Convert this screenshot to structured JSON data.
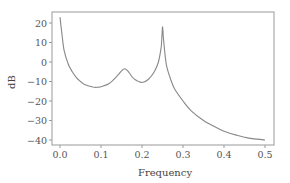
{
  "chart_data": {
    "type": "line",
    "title": "",
    "xlabel": "Frequency",
    "ylabel": "dB",
    "xlim": [
      0.0,
      0.5
    ],
    "ylim": [
      -42,
      27
    ],
    "x_ticks": [
      "0.0",
      "0.1",
      "0.2",
      "0.3",
      "0.4",
      "0.5"
    ],
    "y_ticks": [
      "20",
      "10",
      "0",
      "-10",
      "-20",
      "-30",
      "-40"
    ],
    "grid": false,
    "legend": null,
    "series": [
      {
        "name": "spectrum",
        "color": "#888888",
        "x": [
          0.0,
          0.005,
          0.01,
          0.02,
          0.03,
          0.04,
          0.05,
          0.06,
          0.08,
          0.09,
          0.1,
          0.12,
          0.14,
          0.15,
          0.157,
          0.165,
          0.18,
          0.2,
          0.215,
          0.23,
          0.24,
          0.247,
          0.25,
          0.252,
          0.255,
          0.26,
          0.27,
          0.28,
          0.3,
          0.32,
          0.35,
          0.38,
          0.4,
          0.43,
          0.46,
          0.5
        ],
        "values": [
          23,
          14,
          6,
          -1,
          -5,
          -8,
          -10,
          -11.5,
          -12.8,
          -13,
          -12.7,
          -11,
          -7,
          -4.5,
          -3.5,
          -4.5,
          -8.5,
          -10.5,
          -9,
          -5,
          0,
          8,
          18,
          13,
          6,
          -2,
          -9,
          -14,
          -20,
          -25,
          -30,
          -33.5,
          -35.5,
          -37.5,
          -39,
          -40
        ]
      }
    ]
  }
}
